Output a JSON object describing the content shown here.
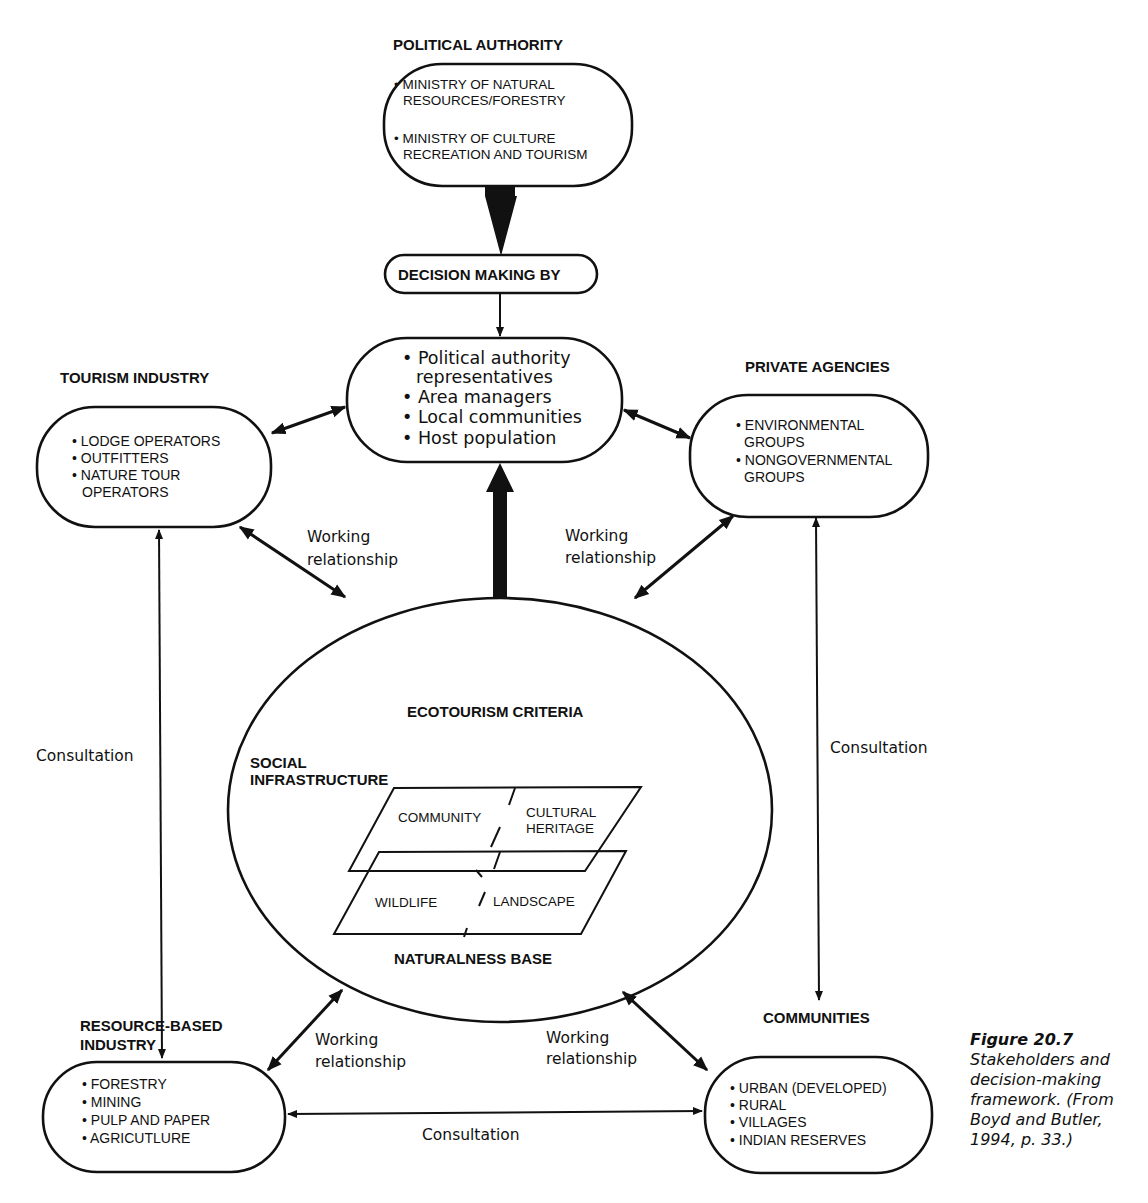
{
  "nodes": {
    "political_authority": {
      "title": "POLITICAL AUTHORITY",
      "items": [
        [
          "• MINISTRY OF NATURAL",
          "RESOURCES/FORESTRY"
        ],
        [
          "• MINISTRY OF CULTURE",
          "RECREATION AND TOURISM"
        ]
      ]
    },
    "decision_making": {
      "title": "DECISION MAKING BY"
    },
    "decision_makers": {
      "items": [
        "• Political authority",
        "representatives",
        "• Area managers",
        "• Local communities",
        "• Host population"
      ]
    },
    "tourism_industry": {
      "title": "TOURISM INDUSTRY",
      "items": [
        "• LODGE OPERATORS",
        "• OUTFITTERS",
        "• NATURE TOUR",
        "OPERATORS"
      ]
    },
    "private_agencies": {
      "title": "PRIVATE AGENCIES",
      "items": [
        "• ENVIRONMENTAL",
        "GROUPS",
        "• NONGOVERNMENTAL",
        "GROUPS"
      ]
    },
    "ecotourism_criteria": {
      "title": "ECOTOURISM CRITERIA",
      "social_label": [
        "SOCIAL",
        "INFRASTRUCTURE"
      ],
      "upper_plane": [
        "COMMUNITY",
        "CULTURAL",
        "HERITAGE"
      ],
      "lower_plane": [
        "WILDLIFE",
        "LANDSCAPE"
      ],
      "base_label": "NATURALNESS BASE"
    },
    "resource_industry": {
      "title": [
        "RESOURCE-BASED",
        "INDUSTRY"
      ],
      "items": [
        "• FORESTRY",
        "• MINING",
        "• PULP AND PAPER",
        "• AGRICUTLURE"
      ]
    },
    "communities": {
      "title": "COMMUNITIES",
      "items": [
        "• URBAN (DEVELOPED)",
        "• RURAL",
        "• VILLAGES",
        "• INDIAN RESERVES"
      ]
    }
  },
  "edges": {
    "working_relationship": [
      "Working",
      "relationship"
    ],
    "consultation": "Consultation"
  },
  "caption": {
    "figure": "Figure 20.7",
    "lines": [
      "Stakeholders and",
      "decision-making",
      "framework. (From",
      "Boyd and Butler,",
      "1994, p. 33.)"
    ]
  }
}
